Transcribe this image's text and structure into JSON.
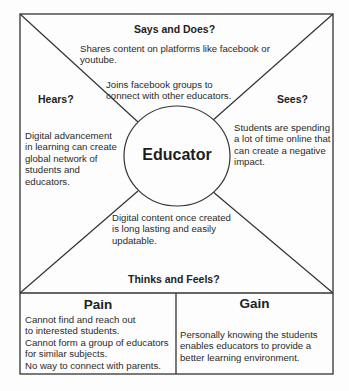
{
  "diagram": {
    "center": "Educator",
    "says_and_does": {
      "heading": "Says and Does?",
      "items": [
        "Shares content on platforms like facebook or youtube.",
        "Joins facebook groups to connect with other educators."
      ]
    },
    "hears": {
      "heading": "Hears?",
      "items": [
        "Digital advancement in learning can create global network of students and educators."
      ]
    },
    "sees": {
      "heading": "Sees?",
      "items": [
        "Students are spending a lot of time online that can create a negative impact."
      ]
    },
    "thinks_and_feels": {
      "heading": "Thinks and Feels?",
      "items": [
        "Digital content once created is long lasting and easily updatable."
      ]
    },
    "pain": {
      "heading": "Pain",
      "items": [
        "Cannot find and reach out to interested students.",
        "Cannot form a group of educators for similar subjects.",
        "No way to connect with parents."
      ]
    },
    "gain": {
      "heading": "Gain",
      "items": [
        "Personally knowing the students enables educators to provide a better learning environment."
      ]
    }
  }
}
